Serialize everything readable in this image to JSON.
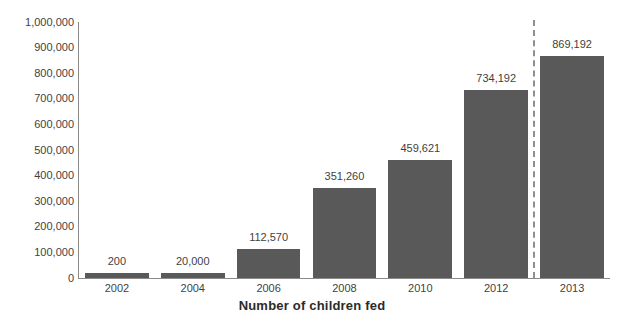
{
  "chart_data": {
    "type": "bar",
    "title": "",
    "xlabel": "Number of children fed",
    "ylabel": "",
    "categories": [
      "2002",
      "2004",
      "2006",
      "2008",
      "2010",
      "2012",
      "2013"
    ],
    "values": [
      200,
      20000,
      112570,
      351260,
      459621,
      734192,
      869192
    ],
    "value_labels": [
      "200",
      "20,000",
      "112,570",
      "351,260",
      "459,621",
      "734,192",
      "869,192"
    ],
    "ylim": [
      0,
      1000000
    ],
    "y_ticks": [
      0,
      100000,
      200000,
      300000,
      400000,
      500000,
      600000,
      700000,
      800000,
      900000,
      1000000
    ],
    "y_tick_labels": [
      "0",
      "100,000",
      "200,000",
      "300,000",
      "400,000",
      "500,000",
      "600,000",
      "700,000",
      "800,000",
      "900,000",
      "1,000,000"
    ],
    "grid": false,
    "legend": null,
    "series": [
      {
        "name": "Number of children fed",
        "color": "#595959",
        "values": [
          200,
          20000,
          112570,
          351260,
          459621,
          734192,
          869192
        ]
      }
    ],
    "annotations": [
      {
        "type": "vertical-dashed-line",
        "between": [
          "2012",
          "2013"
        ],
        "color": "#8f8f8f"
      }
    ],
    "colors": {
      "bar": "#595959",
      "axis": "#8a8a8a",
      "text": "#3f3f3f",
      "title": "#2b2b2b",
      "background": "#ffffff",
      "separator": "#8f8f8f"
    }
  }
}
